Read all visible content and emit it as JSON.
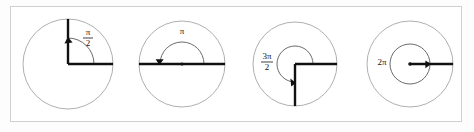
{
  "figure": {
    "background_color": "#ffffff",
    "frame_color": "#cfcfcf",
    "circle_stroke_color": "#9a9a9a",
    "ray_color": "#111111",
    "arc_color": "#5a5a5a"
  },
  "panels": [
    {
      "id": "panel-1",
      "label_text": "π/2",
      "label_numerator": "π",
      "label_denominator": "2",
      "label_is_fraction": true,
      "angle_degrees": 90,
      "angle_radians": "π/2",
      "center_x": 68,
      "center_y": 64,
      "outer_radius": 45,
      "arc_radius": 26,
      "initial_ray_degrees": 0,
      "terminal_ray_degrees": 90,
      "label_x": 88,
      "label_y": 38,
      "direction": "counterclockwise",
      "show_center_dot": false
    },
    {
      "id": "panel-2",
      "label_text": "π",
      "label_numerator": "π",
      "label_denominator": "",
      "label_is_fraction": false,
      "angle_degrees": 180,
      "angle_radians": "π",
      "center_x": 182,
      "center_y": 64,
      "outer_radius": 43,
      "arc_radius": 22,
      "initial_ray_degrees": 0,
      "terminal_ray_degrees": 180,
      "label_x": 182,
      "label_y": 32,
      "direction": "counterclockwise",
      "show_center_dot": true
    },
    {
      "id": "panel-3",
      "label_text": "3π/2",
      "label_numerator": "3π",
      "label_denominator": "2",
      "label_is_fraction": true,
      "angle_degrees": 270,
      "angle_radians": "3π/2",
      "center_x": 295,
      "center_y": 64,
      "outer_radius": 42,
      "arc_radius": 18,
      "initial_ray_degrees": 0,
      "terminal_ray_degrees": 270,
      "label_x": 267,
      "label_y": 62,
      "direction": "counterclockwise",
      "show_center_dot": false
    },
    {
      "id": "panel-4",
      "label_text": "2π",
      "label_numerator": "2π",
      "label_denominator": "",
      "label_is_fraction": false,
      "angle_degrees": 360,
      "angle_radians": "2π",
      "center_x": 410,
      "center_y": 64,
      "outer_radius": 43,
      "arc_radius": 20,
      "initial_ray_degrees": 0,
      "terminal_ray_degrees": 360,
      "label_x": 382,
      "label_y": 62,
      "direction": "counterclockwise",
      "show_center_dot": true
    }
  ]
}
